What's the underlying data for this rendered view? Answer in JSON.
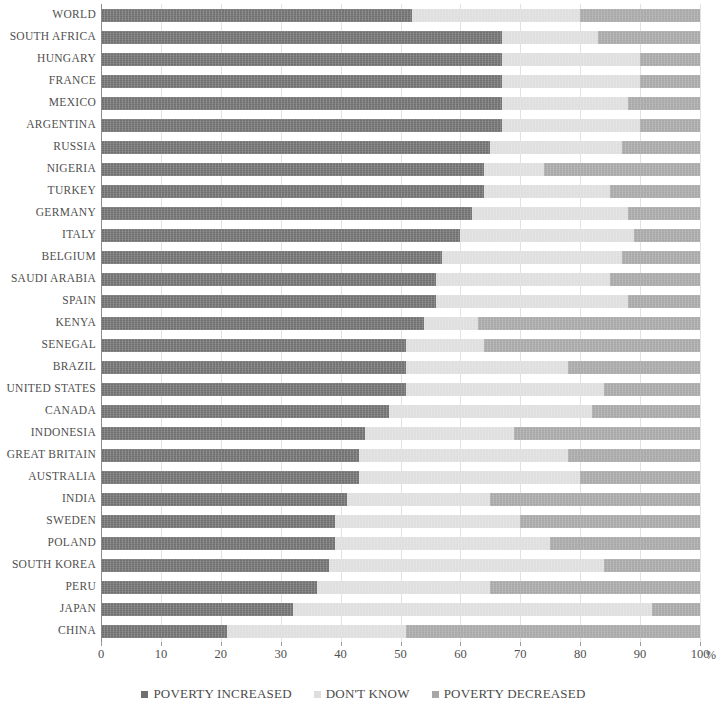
{
  "chart_data": {
    "type": "bar",
    "subtype": "stacked-horizontal-100pct",
    "title": "",
    "xlabel": "%",
    "ylabel": "",
    "xlim": [
      0,
      100
    ],
    "xticks": [
      "0",
      "10",
      "20",
      "30",
      "40",
      "50",
      "60",
      "70",
      "80",
      "90",
      "100"
    ],
    "xtick_values": [
      0,
      10,
      20,
      30,
      40,
      50,
      60,
      70,
      80,
      90,
      100
    ],
    "grid": true,
    "legend_position": "bottom",
    "unit_suffix": "%",
    "colors": {
      "poverty_increased": "#6f6f6f",
      "dont_know": "#dedede",
      "poverty_decreased": "#a7a7a7",
      "gridline": "#e2e2e2",
      "axis": "#8d8d8d",
      "text": "#4a4a4a"
    },
    "series": [
      {
        "name": "POVERTY INCREASED",
        "key": "poverty_increased",
        "color": "#6f6f6f",
        "values": [
          52,
          67,
          67,
          67,
          67,
          67,
          65,
          64,
          64,
          62,
          60,
          57,
          56,
          56,
          54,
          51,
          51,
          51,
          48,
          44,
          43,
          43,
          41,
          39,
          39,
          38,
          36,
          32,
          21
        ]
      },
      {
        "name": "DON'T KNOW",
        "key": "dont_know",
        "color": "#dedede",
        "values": [
          28,
          16,
          23,
          23,
          21,
          23,
          22,
          10,
          21,
          26,
          29,
          30,
          29,
          32,
          9,
          13,
          27,
          33,
          34,
          25,
          35,
          37,
          24,
          31,
          36,
          46,
          29,
          60,
          30
        ]
      },
      {
        "name": "POVERTY DECREASED",
        "key": "poverty_decreased",
        "color": "#a7a7a7",
        "values": [
          20,
          17,
          10,
          10,
          12,
          10,
          13,
          26,
          15,
          12,
          11,
          13,
          15,
          12,
          37,
          36,
          22,
          16,
          18,
          31,
          22,
          20,
          35,
          30,
          25,
          16,
          35,
          8,
          49
        ]
      }
    ],
    "categories": [
      "WORLD",
      "SOUTH AFRICA",
      "HUNGARY",
      "FRANCE",
      "MEXICO",
      "ARGENTINA",
      "RUSSIA",
      "NIGERIA",
      "TURKEY",
      "GERMANY",
      "ITALY",
      "BELGIUM",
      "SAUDI ARABIA",
      "SPAIN",
      "KENYA",
      "SENEGAL",
      "BRAZIL",
      "UNITED STATES",
      "CANADA",
      "INDONESIA",
      "GREAT BRITAIN",
      "AUSTRALIA",
      "INDIA",
      "SWEDEN",
      "POLAND",
      "SOUTH KOREA",
      "PERU",
      "JAPAN",
      "CHINA"
    ],
    "rows": [
      {
        "category": "WORLD",
        "poverty_increased": 52,
        "dont_know": 28,
        "poverty_decreased": 20
      },
      {
        "category": "SOUTH AFRICA",
        "poverty_increased": 67,
        "dont_know": 16,
        "poverty_decreased": 17
      },
      {
        "category": "HUNGARY",
        "poverty_increased": 67,
        "dont_know": 23,
        "poverty_decreased": 10
      },
      {
        "category": "FRANCE",
        "poverty_increased": 67,
        "dont_know": 23,
        "poverty_decreased": 10
      },
      {
        "category": "MEXICO",
        "poverty_increased": 67,
        "dont_know": 21,
        "poverty_decreased": 12
      },
      {
        "category": "ARGENTINA",
        "poverty_increased": 67,
        "dont_know": 23,
        "poverty_decreased": 10
      },
      {
        "category": "RUSSIA",
        "poverty_increased": 65,
        "dont_know": 22,
        "poverty_decreased": 13
      },
      {
        "category": "NIGERIA",
        "poverty_increased": 64,
        "dont_know": 10,
        "poverty_decreased": 26
      },
      {
        "category": "TURKEY",
        "poverty_increased": 64,
        "dont_know": 21,
        "poverty_decreased": 15
      },
      {
        "category": "GERMANY",
        "poverty_increased": 62,
        "dont_know": 26,
        "poverty_decreased": 12
      },
      {
        "category": "ITALY",
        "poverty_increased": 60,
        "dont_know": 29,
        "poverty_decreased": 11
      },
      {
        "category": "BELGIUM",
        "poverty_increased": 57,
        "dont_know": 30,
        "poverty_decreased": 13
      },
      {
        "category": "SAUDI ARABIA",
        "poverty_increased": 56,
        "dont_know": 29,
        "poverty_decreased": 15
      },
      {
        "category": "SPAIN",
        "poverty_increased": 56,
        "dont_know": 32,
        "poverty_decreased": 12
      },
      {
        "category": "KENYA",
        "poverty_increased": 54,
        "dont_know": 9,
        "poverty_decreased": 37
      },
      {
        "category": "SENEGAL",
        "poverty_increased": 51,
        "dont_know": 13,
        "poverty_decreased": 36
      },
      {
        "category": "BRAZIL",
        "poverty_increased": 51,
        "dont_know": 27,
        "poverty_decreased": 22
      },
      {
        "category": "UNITED STATES",
        "poverty_increased": 51,
        "dont_know": 33,
        "poverty_decreased": 16
      },
      {
        "category": "CANADA",
        "poverty_increased": 48,
        "dont_know": 34,
        "poverty_decreased": 18
      },
      {
        "category": "INDONESIA",
        "poverty_increased": 44,
        "dont_know": 25,
        "poverty_decreased": 31
      },
      {
        "category": "GREAT BRITAIN",
        "poverty_increased": 43,
        "dont_know": 35,
        "poverty_decreased": 22
      },
      {
        "category": "AUSTRALIA",
        "poverty_increased": 43,
        "dont_know": 37,
        "poverty_decreased": 20
      },
      {
        "category": "INDIA",
        "poverty_increased": 41,
        "dont_know": 24,
        "poverty_decreased": 35
      },
      {
        "category": "SWEDEN",
        "poverty_increased": 39,
        "dont_know": 31,
        "poverty_decreased": 30
      },
      {
        "category": "POLAND",
        "poverty_increased": 39,
        "dont_know": 36,
        "poverty_decreased": 25
      },
      {
        "category": "SOUTH KOREA",
        "poverty_increased": 38,
        "dont_know": 46,
        "poverty_decreased": 16
      },
      {
        "category": "PERU",
        "poverty_increased": 36,
        "dont_know": 29,
        "poverty_decreased": 35
      },
      {
        "category": "JAPAN",
        "poverty_increased": 32,
        "dont_know": 60,
        "poverty_decreased": 8
      },
      {
        "category": "CHINA",
        "poverty_increased": 21,
        "dont_know": 30,
        "poverty_decreased": 49
      }
    ]
  },
  "legend": {
    "items": [
      {
        "label": "POVERTY INCREASED",
        "color": "#6f6f6f",
        "key": "poverty_increased"
      },
      {
        "label": "DON'T KNOW",
        "color": "#dedede",
        "key": "dont_know"
      },
      {
        "label": "POVERTY DECREASED",
        "color": "#a7a7a7",
        "key": "poverty_decreased"
      }
    ]
  },
  "axis": {
    "unit": "%"
  }
}
